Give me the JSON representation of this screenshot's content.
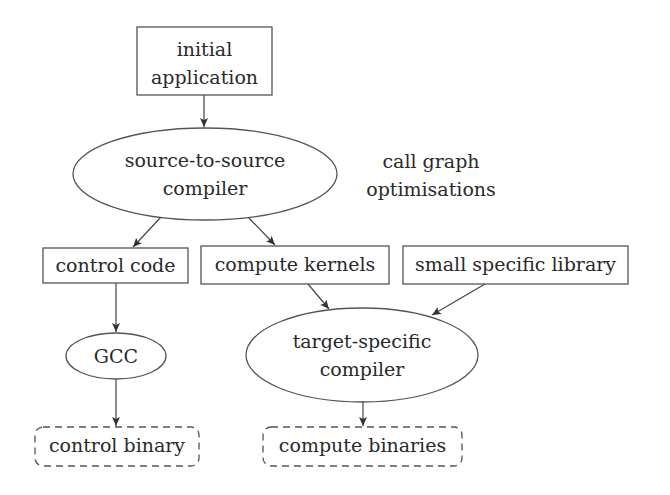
{
  "diagram": {
    "type": "flowchart",
    "nodes": {
      "initial_application": {
        "shape": "rectangle",
        "line1": "initial",
        "line2": "application"
      },
      "s2s_compiler": {
        "shape": "ellipse",
        "line1": "source-to-source",
        "line2": "compiler"
      },
      "control_code": {
        "shape": "rectangle",
        "label": "control code"
      },
      "compute_kernels": {
        "shape": "rectangle",
        "label": "compute kernels"
      },
      "small_library": {
        "shape": "rectangle",
        "label": "small specific library"
      },
      "gcc": {
        "shape": "ellipse",
        "label": "GCC"
      },
      "target_compiler": {
        "shape": "ellipse",
        "line1": "target-specific",
        "line2": "compiler"
      },
      "control_binary": {
        "shape": "dashed-rounded-rectangle",
        "label": "control binary"
      },
      "compute_binaries": {
        "shape": "dashed-rounded-rectangle",
        "label": "compute binaries"
      }
    },
    "annotation": {
      "line1": "call graph",
      "line2": "optimisations"
    },
    "edges": [
      {
        "from": "initial application",
        "to": "source-to-source compiler"
      },
      {
        "from": "source-to-source compiler",
        "to": "control code"
      },
      {
        "from": "source-to-source compiler",
        "to": "compute kernels"
      },
      {
        "from": "control code",
        "to": "GCC"
      },
      {
        "from": "compute kernels",
        "to": "target-specific compiler"
      },
      {
        "from": "small specific library",
        "to": "target-specific compiler"
      },
      {
        "from": "GCC",
        "to": "control binary"
      },
      {
        "from": "target-specific compiler",
        "to": "compute binaries"
      }
    ],
    "colors": {
      "stroke": "#555555",
      "text": "#2a2a2a",
      "background": "#ffffff"
    }
  }
}
